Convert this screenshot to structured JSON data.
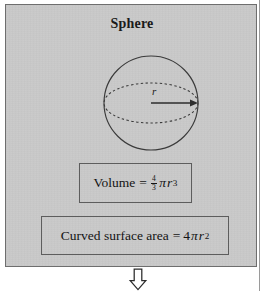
{
  "figure": {
    "title": "Sphere",
    "panel_color": "#c9c9c9",
    "border_color": "#6e6e6e",
    "text_color": "#141414"
  },
  "diagram": {
    "name": "sphere-with-radius",
    "radius_label": "r",
    "circle": {
      "cx": 145,
      "cy": 98,
      "r": 47
    },
    "equator": {
      "type": "dashed-ellipse",
      "rx": 47,
      "ry": 20
    },
    "radius_arrow": {
      "from": "center",
      "to": "right-edge",
      "direction": "right"
    }
  },
  "formulas": {
    "volume": {
      "label": "Volume",
      "equals": "=",
      "fraction_numerator": "4",
      "fraction_denominator": "3",
      "pi": "π",
      "variable": "r",
      "exponent": "3",
      "plain_text": "Volume = 4/3 πr³"
    },
    "surface_area": {
      "label": "Curved surface area",
      "equals": "=",
      "coefficient": "4",
      "pi": "π",
      "variable": "r",
      "exponent": "2",
      "plain_text": "Curved surface area = 4πr²"
    }
  },
  "flow": {
    "arrow_down": "⇓"
  }
}
